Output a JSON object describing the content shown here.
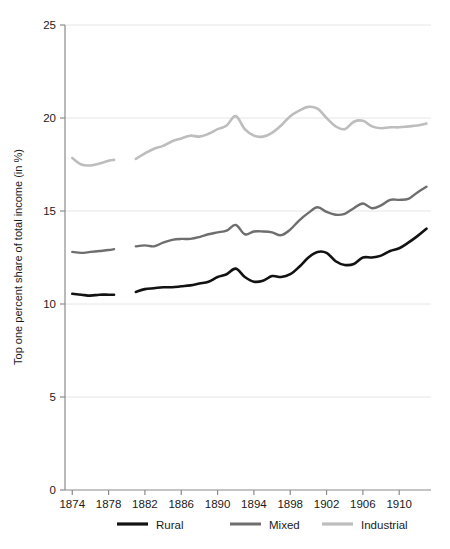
{
  "chart_data": {
    "type": "line",
    "title": "",
    "xlabel": "",
    "ylabel": "Top one percent share of total income (in %)",
    "xlim": [
      1873.2,
      1913.5
    ],
    "ylim": [
      0,
      25
    ],
    "grid": true,
    "grid_axis": "y",
    "legend_position": "bottom",
    "x_ticks": [
      1874,
      1878,
      1882,
      1886,
      1890,
      1894,
      1898,
      1902,
      1906,
      1910
    ],
    "y_ticks": [
      0,
      5,
      10,
      15,
      20,
      25
    ],
    "colors": {
      "rural": "#121212",
      "mixed": "#6e6e6e",
      "industrial": "#bdbdbd",
      "grid": "#e6e6e6",
      "axis": "#8a8a8a",
      "background": "#ffffff"
    },
    "series": [
      {
        "name": "Rural",
        "color": "#121212",
        "width": 2.6,
        "segments": [
          {
            "x": [
              1874,
              1875,
              1876,
              1877,
              1878,
              1878.6
            ],
            "values": [
              10.55,
              10.5,
              10.45,
              10.5,
              10.5,
              10.5
            ]
          },
          {
            "x": [
              1881,
              1882,
              1883,
              1884,
              1885,
              1886,
              1887,
              1888,
              1889,
              1890,
              1891,
              1892,
              1893,
              1894,
              1895,
              1896,
              1897,
              1898,
              1899,
              1900,
              1901,
              1902,
              1903,
              1904,
              1905,
              1906,
              1907,
              1908,
              1909,
              1910,
              1911,
              1912,
              1913
            ],
            "values": [
              10.65,
              10.8,
              10.85,
              10.9,
              10.9,
              10.95,
              11.0,
              11.1,
              11.2,
              11.45,
              11.6,
              11.9,
              11.45,
              11.2,
              11.25,
              11.5,
              11.45,
              11.6,
              12.0,
              12.5,
              12.8,
              12.75,
              12.3,
              12.1,
              12.15,
              12.5,
              12.5,
              12.6,
              12.85,
              13.0,
              13.3,
              13.65,
              14.05
            ]
          }
        ]
      },
      {
        "name": "Mixed",
        "color": "#6e6e6e",
        "width": 2.4,
        "segments": [
          {
            "x": [
              1874,
              1875,
              1876,
              1877,
              1878,
              1878.6
            ],
            "values": [
              12.8,
              12.75,
              12.8,
              12.85,
              12.9,
              12.95
            ]
          },
          {
            "x": [
              1881,
              1882,
              1883,
              1884,
              1885,
              1886,
              1887,
              1888,
              1889,
              1890,
              1891,
              1892,
              1893,
              1894,
              1895,
              1896,
              1897,
              1898,
              1899,
              1900,
              1901,
              1902,
              1903,
              1904,
              1905,
              1906,
              1907,
              1908,
              1909,
              1910,
              1911,
              1912,
              1913
            ],
            "values": [
              13.1,
              13.15,
              13.1,
              13.3,
              13.45,
              13.5,
              13.5,
              13.6,
              13.75,
              13.85,
              13.95,
              14.25,
              13.75,
              13.9,
              13.9,
              13.85,
              13.7,
              14.0,
              14.5,
              14.9,
              15.2,
              14.95,
              14.8,
              14.85,
              15.15,
              15.4,
              15.15,
              15.3,
              15.6,
              15.6,
              15.65,
              16.0,
              16.3
            ]
          }
        ]
      },
      {
        "name": "Industrial",
        "color": "#bdbdbd",
        "width": 2.6,
        "segments": [
          {
            "x": [
              1874,
              1875,
              1876,
              1877,
              1878,
              1878.6
            ],
            "values": [
              17.85,
              17.5,
              17.45,
              17.55,
              17.7,
              17.75
            ]
          },
          {
            "x": [
              1881,
              1882,
              1883,
              1884,
              1885,
              1886,
              1887,
              1888,
              1889,
              1890,
              1891,
              1892,
              1893,
              1894,
              1895,
              1896,
              1897,
              1898,
              1899,
              1900,
              1901,
              1902,
              1903,
              1904,
              1905,
              1906,
              1907,
              1908,
              1909,
              1910,
              1911,
              1912,
              1913
            ],
            "values": [
              17.8,
              18.1,
              18.35,
              18.5,
              18.75,
              18.9,
              19.05,
              19.0,
              19.15,
              19.4,
              19.6,
              20.1,
              19.4,
              19.05,
              19.0,
              19.2,
              19.6,
              20.1,
              20.4,
              20.6,
              20.5,
              20.0,
              19.55,
              19.4,
              19.8,
              19.85,
              19.55,
              19.45,
              19.5,
              19.5,
              19.55,
              19.6,
              19.7
            ]
          }
        ]
      }
    ]
  },
  "legend": {
    "items": [
      {
        "label": "Rural"
      },
      {
        "label": "Mixed"
      },
      {
        "label": "Industrial"
      }
    ]
  }
}
